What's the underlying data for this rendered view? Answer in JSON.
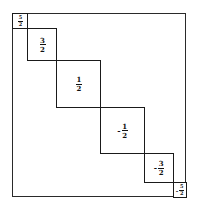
{
  "diagram": {
    "type": "block-diagonal-matrix",
    "blocks": [
      {
        "sign": "",
        "numerator": "5",
        "denominator": "2",
        "value": "5/2",
        "rel_size": 1
      },
      {
        "sign": "",
        "numerator": "3",
        "denominator": "2",
        "value": "3/2",
        "rel_size": 2
      },
      {
        "sign": "",
        "numerator": "1",
        "denominator": "2",
        "value": "1/2",
        "rel_size": 3
      },
      {
        "sign": "-",
        "numerator": "1",
        "denominator": "2",
        "value": "-1/2",
        "rel_size": 3
      },
      {
        "sign": "-",
        "numerator": "3",
        "denominator": "2",
        "value": "-3/2",
        "rel_size": 2
      },
      {
        "sign": "-",
        "numerator": "5",
        "denominator": "2",
        "value": "-5/2",
        "rel_size": 1
      }
    ],
    "colors": {
      "line": "#1a1a1a",
      "background": "#ffffff"
    }
  }
}
